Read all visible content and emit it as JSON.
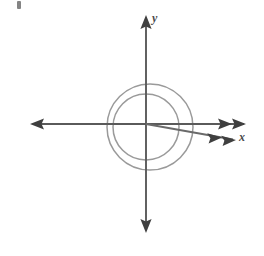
{
  "figure": {
    "background_color": "#ffffff",
    "width": 264,
    "height": 256
  },
  "labels": {
    "y_axis": "y",
    "x_axis": "x",
    "label_color": "#4a4a4a"
  },
  "colors": {
    "axis": "#555555",
    "curve": "#9a9a9a",
    "ray": "#6a6a6a",
    "arrowhead": "#3f3f3f",
    "corner_mark": "#6f6f6f"
  },
  "chart_data": {
    "type": "line",
    "xlabel": "x",
    "ylabel": "y",
    "grid": false,
    "legend": "none",
    "origin_px": [
      146,
      124
    ],
    "axes": {
      "x_axis": {
        "y_px": 124,
        "x_start_px": 30,
        "x_end_px": 246,
        "arrows": "both",
        "double_arrowhead_right": true,
        "label": "x"
      },
      "y_axis": {
        "x_px": 146,
        "y_start_px": 15,
        "y_end_px": 233,
        "arrows": "both",
        "label": "y"
      }
    },
    "series": [
      {
        "name": "inner-loop",
        "kind": "circle",
        "center_px": [
          146,
          127
        ],
        "radius_px": 33,
        "color": "#9a9a9a"
      },
      {
        "name": "outer-loop",
        "kind": "circle",
        "center_px": [
          150,
          127
        ],
        "radius_px": 43,
        "color": "#9a9a9a"
      },
      {
        "name": "terminal-ray",
        "kind": "ray",
        "from_px": [
          146,
          124
        ],
        "to_px": [
          236,
          140
        ],
        "angle_deg": -10,
        "arrowhead": "double",
        "color": "#6a6a6a"
      }
    ],
    "annotations": [
      {
        "text": "y",
        "x_px": 152,
        "y_px": 12,
        "style": "italic"
      },
      {
        "text": "x",
        "x_px": 239,
        "y_px": 131,
        "style": "italic"
      }
    ]
  }
}
